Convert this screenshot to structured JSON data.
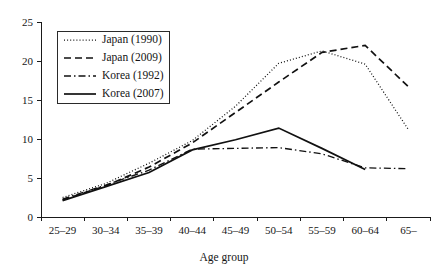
{
  "chart_data": {
    "type": "line",
    "title": "",
    "xlabel": "Age group",
    "ylabel": "",
    "categories": [
      "25–29",
      "30–34",
      "35–39",
      "40–44",
      "45–49",
      "50–54",
      "55–59",
      "60–64",
      "65–"
    ],
    "ylim": [
      0,
      25
    ],
    "yticks": [
      0,
      5,
      10,
      15,
      20,
      25
    ],
    "ytick_labels": [
      "0",
      "5",
      "10",
      "15",
      "20",
      "25"
    ],
    "grid": false,
    "legend_position": "upper-left",
    "series": [
      {
        "name": "Japan (1990)",
        "style": "dotted",
        "values": [
          2.5,
          4.3,
          6.9,
          9.8,
          14.2,
          19.7,
          21.3,
          19.6,
          11.2
        ]
      },
      {
        "name": "Japan (2009)",
        "style": "dashed",
        "values": [
          2.2,
          4.0,
          6.4,
          9.5,
          13.4,
          17.3,
          21.1,
          22.0,
          16.7
        ]
      },
      {
        "name": "Korea (1992)",
        "style": "dash-dot",
        "values": [
          2.3,
          4.1,
          6.0,
          8.7,
          8.8,
          8.9,
          8.1,
          6.3,
          6.2
        ]
      },
      {
        "name": "Korea (2007)",
        "style": "solid",
        "values": [
          2.1,
          3.9,
          5.7,
          8.6,
          9.9,
          11.4,
          8.8,
          6.1,
          null
        ]
      }
    ]
  },
  "legend": {
    "items": [
      {
        "label": "Japan (1990)",
        "style": "dotted"
      },
      {
        "label": "Japan (2009)",
        "style": "dashed"
      },
      {
        "label": "Korea (1992)",
        "style": "dash-dot"
      },
      {
        "label": "Korea (2007)",
        "style": "solid"
      }
    ]
  },
  "layout": {
    "plot_left": 41,
    "plot_right": 430,
    "plot_top": 22,
    "plot_bottom": 217,
    "legend_x": 57,
    "legend_y": 31,
    "legend_w": 112,
    "legend_h": 72,
    "xlabel_x": 224,
    "xlabel_y": 261
  },
  "colors": {
    "ink": "#111111",
    "axis": "#1a1a1a",
    "background": "#ffffff"
  }
}
